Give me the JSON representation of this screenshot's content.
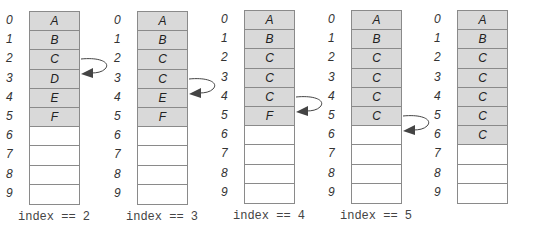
{
  "diagram": {
    "title": "",
    "indices": [
      "0",
      "1",
      "2",
      "3",
      "4",
      "5",
      "6",
      "7",
      "8",
      "9"
    ],
    "panels": [
      {
        "cells": [
          "A",
          "B",
          "C",
          "D",
          "E",
          "F",
          "",
          "",
          "",
          ""
        ],
        "filled": 6,
        "label": "index == 2",
        "arrow_from": 2
      },
      {
        "cells": [
          "A",
          "B",
          "C",
          "C",
          "E",
          "F",
          "",
          "",
          "",
          ""
        ],
        "filled": 6,
        "label": "index == 3",
        "arrow_from": 3
      },
      {
        "cells": [
          "A",
          "B",
          "C",
          "C",
          "C",
          "F",
          "",
          "",
          "",
          ""
        ],
        "filled": 6,
        "label": "index == 4",
        "arrow_from": 4
      },
      {
        "cells": [
          "A",
          "B",
          "C",
          "C",
          "C",
          "C",
          "",
          "",
          "",
          ""
        ],
        "filled": 6,
        "label": "index == 5",
        "arrow_from": 5
      },
      {
        "cells": [
          "A",
          "B",
          "C",
          "C",
          "C",
          "C",
          "C",
          "",
          "",
          ""
        ],
        "filled": 7,
        "label": "",
        "arrow_from": null
      }
    ],
    "colors": {
      "filled_cell": "#d9d9d9",
      "border": "#8a8a8a",
      "arrow": "#444444"
    }
  }
}
